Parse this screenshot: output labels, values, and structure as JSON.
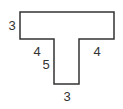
{
  "diagram": {
    "type": "T-shaped polygon",
    "stroke_color": "#333333",
    "fill_color": "#ffffff",
    "points": [
      [
        20,
        12
      ],
      [
        114,
        12
      ],
      [
        114,
        39
      ],
      [
        79,
        39
      ],
      [
        79,
        84
      ],
      [
        54,
        84
      ],
      [
        54,
        39
      ],
      [
        20,
        39
      ]
    ],
    "labels": [
      {
        "id": "top-bar-height",
        "text": "3",
        "x": 12,
        "y": 25
      },
      {
        "id": "left-overhang",
        "text": "4",
        "x": 37,
        "y": 51
      },
      {
        "id": "stem-height",
        "text": "5",
        "x": 46,
        "y": 64
      },
      {
        "id": "right-overhang",
        "text": "4",
        "x": 97,
        "y": 51
      },
      {
        "id": "stem-width",
        "text": "3",
        "x": 67,
        "y": 96
      }
    ]
  }
}
